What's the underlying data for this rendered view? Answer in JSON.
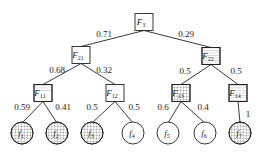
{
  "diagram": {
    "type": "tree",
    "nodes": {
      "F3": {
        "label": "F",
        "sub": "3",
        "x": 144,
        "y": 22,
        "shape": "box",
        "pattern": "none"
      },
      "F21": {
        "label": "F",
        "sub": "21",
        "x": 81,
        "y": 55,
        "shape": "box",
        "pattern": "none"
      },
      "F22": {
        "label": "F",
        "sub": "22",
        "x": 211,
        "y": 56,
        "shape": "box",
        "pattern": "hlines"
      },
      "F11": {
        "label": "F",
        "sub": "11",
        "x": 43,
        "y": 93,
        "shape": "box",
        "pattern": "hlines-top"
      },
      "F12": {
        "label": "F",
        "sub": "12",
        "x": 115,
        "y": 93,
        "shape": "box",
        "pattern": "none"
      },
      "F13": {
        "label": "F",
        "sub": "13",
        "x": 181,
        "y": 93,
        "shape": "box",
        "pattern": "grid"
      },
      "F14": {
        "label": "F",
        "sub": "14",
        "x": 238,
        "y": 93,
        "shape": "box",
        "pattern": "hlines"
      },
      "f1": {
        "label": "f",
        "sub": "1",
        "x": 22,
        "y": 133,
        "shape": "circle",
        "pattern": "grid"
      },
      "f2": {
        "label": "f",
        "sub": "2",
        "x": 57,
        "y": 133,
        "shape": "circle",
        "pattern": "grid"
      },
      "f3": {
        "label": "f",
        "sub": "3",
        "x": 92,
        "y": 133,
        "shape": "circle",
        "pattern": "grid"
      },
      "f4": {
        "label": "f",
        "sub": "4",
        "x": 133,
        "y": 133,
        "shape": "circle",
        "pattern": "none"
      },
      "f5": {
        "label": "f",
        "sub": "5",
        "x": 168,
        "y": 133,
        "shape": "circle",
        "pattern": "none"
      },
      "f6": {
        "label": "f",
        "sub": "6",
        "x": 205,
        "y": 133,
        "shape": "circle",
        "pattern": "none"
      },
      "f7": {
        "label": "f",
        "sub": "7",
        "x": 240,
        "y": 133,
        "shape": "circle",
        "pattern": "grid"
      }
    },
    "edges": [
      {
        "from": "F3",
        "to": "F21",
        "weight": "0.71",
        "lx": 104,
        "ly": 37
      },
      {
        "from": "F3",
        "to": "F22",
        "weight": "0.29",
        "lx": 186,
        "ly": 37
      },
      {
        "from": "F21",
        "to": "F11",
        "weight": "0.68",
        "lx": 57,
        "ly": 73
      },
      {
        "from": "F21",
        "to": "F12",
        "weight": "0.32",
        "lx": 104,
        "ly": 73
      },
      {
        "from": "F22",
        "to": "F13",
        "weight": "0.5",
        "lx": 185,
        "ly": 74
      },
      {
        "from": "F22",
        "to": "F14",
        "weight": "0.5",
        "lx": 236,
        "ly": 74
      },
      {
        "from": "F11",
        "to": "f1",
        "weight": "0.59",
        "lx": 22,
        "ly": 110
      },
      {
        "from": "F11",
        "to": "f2",
        "weight": "0.41",
        "lx": 63,
        "ly": 110
      },
      {
        "from": "F12",
        "to": "f3",
        "weight": "0.5",
        "lx": 92,
        "ly": 110
      },
      {
        "from": "F12",
        "to": "f4",
        "weight": "0.5",
        "lx": 134,
        "ly": 110
      },
      {
        "from": "F13",
        "to": "f5",
        "weight": "0.6",
        "lx": 163,
        "ly": 110
      },
      {
        "from": "F13",
        "to": "f6",
        "weight": "0.4",
        "lx": 203,
        "ly": 110
      },
      {
        "from": "F14",
        "to": "f7",
        "weight": "1",
        "lx": 248,
        "ly": 117
      }
    ]
  }
}
